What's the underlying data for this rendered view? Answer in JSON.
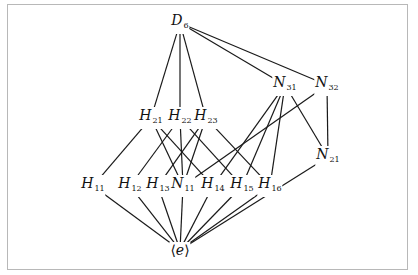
{
  "diagram": {
    "nodes": [
      {
        "id": "D6",
        "base": "D",
        "sub": "6",
        "x": 180,
        "y": 23
      },
      {
        "id": "N31",
        "base": "N",
        "sub": "31",
        "x": 285,
        "y": 85
      },
      {
        "id": "N32",
        "base": "N",
        "sub": "32",
        "x": 327,
        "y": 85
      },
      {
        "id": "H21",
        "base": "H",
        "sub": "21",
        "x": 151,
        "y": 118
      },
      {
        "id": "H22",
        "base": "H",
        "sub": "22",
        "x": 180,
        "y": 118
      },
      {
        "id": "H23",
        "base": "H",
        "sub": "23",
        "x": 206,
        "y": 118
      },
      {
        "id": "N21",
        "base": "N",
        "sub": "21",
        "x": 328,
        "y": 157
      },
      {
        "id": "H11",
        "base": "H",
        "sub": "11",
        "x": 93,
        "y": 186
      },
      {
        "id": "H12",
        "base": "H",
        "sub": "12",
        "x": 130,
        "y": 186
      },
      {
        "id": "H13",
        "base": "H",
        "sub": "13",
        "x": 158,
        "y": 186
      },
      {
        "id": "N11",
        "base": "N",
        "sub": "11",
        "x": 183,
        "y": 186
      },
      {
        "id": "H14",
        "base": "H",
        "sub": "14",
        "x": 213,
        "y": 186
      },
      {
        "id": "H15",
        "base": "H",
        "sub": "15",
        "x": 242,
        "y": 186
      },
      {
        "id": "H16",
        "base": "H",
        "sub": "16",
        "x": 270,
        "y": 186
      },
      {
        "id": "e",
        "base": "⟨e⟩",
        "sub": "",
        "x": 180,
        "y": 250
      }
    ],
    "edges": [
      [
        "D6",
        "H21"
      ],
      [
        "D6",
        "H22"
      ],
      [
        "D6",
        "H23"
      ],
      [
        "D6",
        "N31"
      ],
      [
        "D6",
        "N32"
      ],
      [
        "H21",
        "H11"
      ],
      [
        "H21",
        "N11"
      ],
      [
        "H21",
        "H14"
      ],
      [
        "H22",
        "H12"
      ],
      [
        "H22",
        "N11"
      ],
      [
        "H22",
        "H15"
      ],
      [
        "H23",
        "H13"
      ],
      [
        "H23",
        "N11"
      ],
      [
        "H23",
        "H16"
      ],
      [
        "N31",
        "H14"
      ],
      [
        "N31",
        "H15"
      ],
      [
        "N31",
        "H16"
      ],
      [
        "N31",
        "N21"
      ],
      [
        "N32",
        "N11"
      ],
      [
        "N32",
        "N21"
      ],
      [
        "H11",
        "e"
      ],
      [
        "H12",
        "e"
      ],
      [
        "H13",
        "e"
      ],
      [
        "N11",
        "e"
      ],
      [
        "H14",
        "e"
      ],
      [
        "H15",
        "e"
      ],
      [
        "H16",
        "e"
      ],
      [
        "N21",
        "e"
      ]
    ]
  }
}
